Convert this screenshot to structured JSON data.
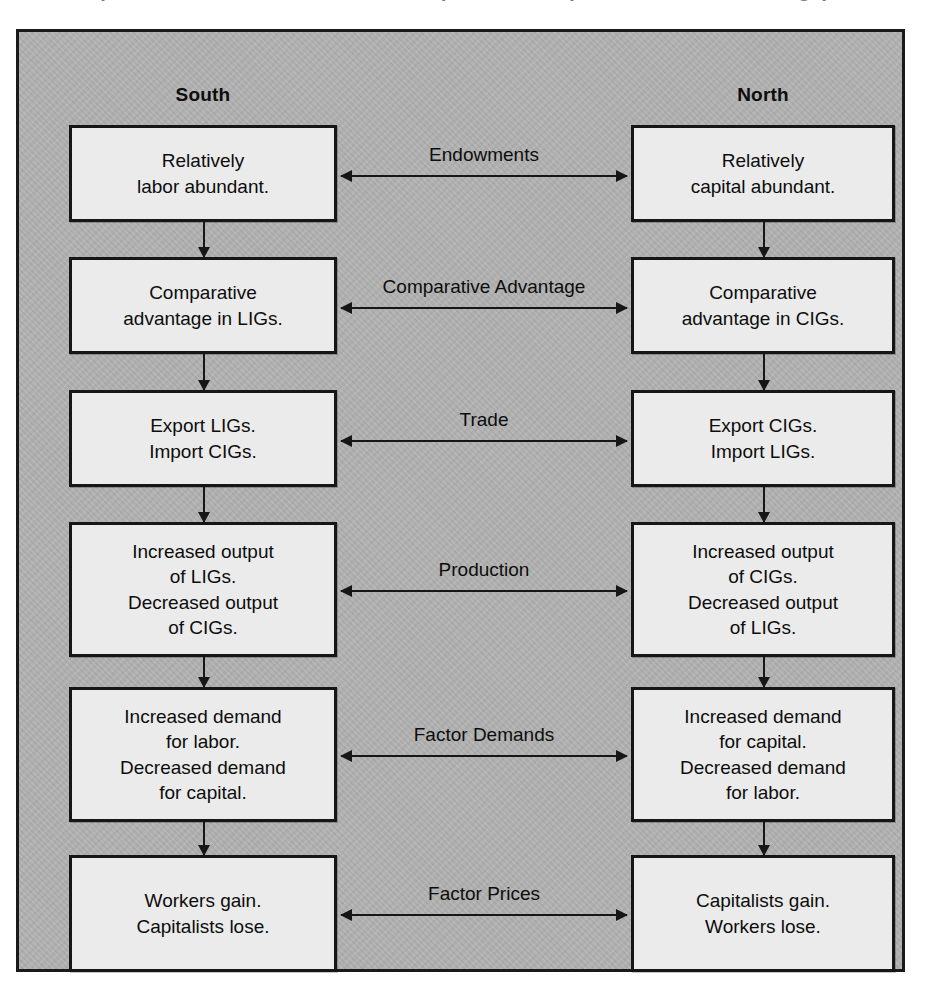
{
  "figure": {
    "title_remnant": "(The North–South Trade Model: Impacts on Outputs and Factor Earnings)",
    "columns": [
      {
        "key": "south",
        "label": "South"
      },
      {
        "key": "north",
        "label": "North"
      }
    ],
    "rows": [
      {
        "connector_label": "Endowments",
        "south": "Relatively\nlabor abundant.",
        "north": "Relatively\ncapital abundant."
      },
      {
        "connector_label": "Comparative Advantage",
        "south": "Comparative\nadvantage in LIGs.",
        "north": "Comparative\nadvantage in CIGs."
      },
      {
        "connector_label": "Trade",
        "south": "Export LIGs.\nImport CIGs.",
        "north": "Export CIGs.\nImport LIGs."
      },
      {
        "connector_label": "Production",
        "south": "Increased output\nof LIGs.\nDecreased output\nof CIGs.",
        "north": "Increased output\nof CIGs.\nDecreased output\nof LIGs."
      },
      {
        "connector_label": "Factor Demands",
        "south": "Increased demand\nfor labor.\nDecreased demand\nfor capital.",
        "north": "Increased demand\nfor capital.\nDecreased demand\nfor labor."
      },
      {
        "connector_label": "Factor Prices",
        "south": "Workers gain.\nCapitalists lose.",
        "north": "Capitalists gain.\nWorkers lose."
      }
    ]
  },
  "colors": {
    "panel_background": "#b2b2b2",
    "node_background": "#ebebeb",
    "stroke": "#161616",
    "page_background": "#ffffff"
  }
}
